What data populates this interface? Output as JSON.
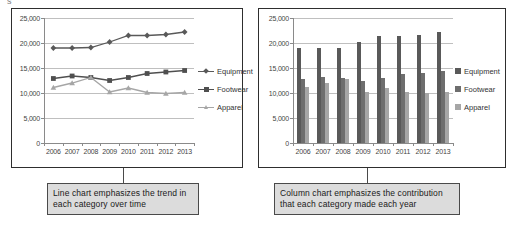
{
  "page": {
    "cut_text": "s",
    "background": "#ffffff"
  },
  "colors": {
    "equipment": "#595959",
    "footwear": "#4f4f4f",
    "apparel": "#a6a6a6",
    "grid": "#bfbfbf",
    "axis": "#8a8a8a",
    "panel_border": "#2e2e2e",
    "caption_fill": "#dcdcdc",
    "caption_border": "#4a4a4a",
    "text": "#333333"
  },
  "line_panel": {
    "name": "line-chart-panel",
    "legend": [
      {
        "label": "Equipment",
        "marker": "diamond",
        "color": "#595959"
      },
      {
        "label": "Footwear",
        "marker": "square",
        "color": "#4f4f4f"
      },
      {
        "label": "Apparel",
        "marker": "triangle",
        "color": "#a6a6a6"
      }
    ]
  },
  "column_panel": {
    "name": "column-chart-panel",
    "legend": [
      {
        "label": "Equipment",
        "marker": "square",
        "color": "#595959"
      },
      {
        "label": "Footwear",
        "marker": "square",
        "color": "#6e6e6e"
      },
      {
        "label": "Apparel",
        "marker": "square",
        "color": "#a6a6a6"
      }
    ]
  },
  "captions": {
    "line": "Line chart emphasizes the trend in each category over time",
    "column": "Column chart emphasizes the contribution that each category made each year"
  },
  "chart_data": [
    {
      "type": "line",
      "title": "",
      "xlabel": "",
      "ylabel": "",
      "categories": [
        "2006",
        "2007",
        "2008",
        "2009",
        "2010",
        "2011",
        "2012",
        "2013"
      ],
      "ylim": [
        0,
        25000
      ],
      "yticks": [
        0,
        5000,
        10000,
        15000,
        20000,
        25000
      ],
      "ytick_labels": [
        "0",
        "5,000",
        "10,000",
        "15,000",
        "20,000",
        "25,000"
      ],
      "grid": true,
      "legend_position": "right",
      "series": [
        {
          "name": "Equipment",
          "color": "#595959",
          "marker": "diamond",
          "values": [
            19000,
            19000,
            19100,
            20200,
            21500,
            21500,
            21700,
            22200
          ]
        },
        {
          "name": "Footwear",
          "color": "#4f4f4f",
          "marker": "square",
          "values": [
            12900,
            13400,
            13100,
            12500,
            13100,
            13900,
            14200,
            14500
          ]
        },
        {
          "name": "Apparel",
          "color": "#a6a6a6",
          "marker": "triangle",
          "values": [
            11100,
            12000,
            13100,
            10200,
            11000,
            10100,
            9900,
            10100
          ]
        }
      ]
    },
    {
      "type": "bar",
      "title": "",
      "xlabel": "",
      "ylabel": "",
      "categories": [
        "2006",
        "2007",
        "2008",
        "2009",
        "2010",
        "2011",
        "2012",
        "2013"
      ],
      "ylim": [
        0,
        25000
      ],
      "yticks": [
        0,
        5000,
        10000,
        15000,
        20000,
        25000
      ],
      "ytick_labels": [
        "0",
        "5,000",
        "10,000",
        "15,000",
        "20,000",
        "25,000"
      ],
      "grid": true,
      "legend_position": "right",
      "series": [
        {
          "name": "Equipment",
          "color": "#595959",
          "values": [
            19000,
            19100,
            19100,
            20200,
            21500,
            21500,
            21700,
            22200
          ]
        },
        {
          "name": "Footwear",
          "color": "#6e6e6e",
          "values": [
            12800,
            13200,
            13000,
            12500,
            13000,
            13800,
            14100,
            14400
          ]
        },
        {
          "name": "Apparel",
          "color": "#a6a6a6",
          "values": [
            11200,
            12000,
            12900,
            10200,
            11100,
            10200,
            10000,
            10200
          ]
        }
      ]
    }
  ]
}
